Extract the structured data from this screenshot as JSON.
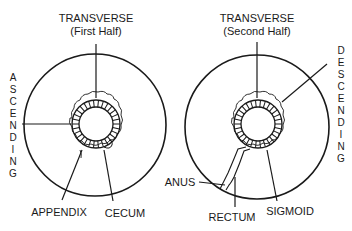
{
  "diagrams": [
    {
      "name": "left",
      "labels": {
        "transverse": "TRANSVERSE",
        "transverse_sub": "(First Half)",
        "side": "ASCENDING",
        "bottom_left": "APPENDIX",
        "bottom_right": "CECUM"
      }
    },
    {
      "name": "right",
      "labels": {
        "transverse": "TRANSVERSE",
        "transverse_sub": "(Second Half)",
        "side": "DESCENDING",
        "anus": "ANUS",
        "rectum": "RECTUM",
        "sigmoid": "SIGMOID"
      }
    }
  ],
  "colors": {
    "stroke": "#1a1a1a",
    "background": "#ffffff"
  }
}
